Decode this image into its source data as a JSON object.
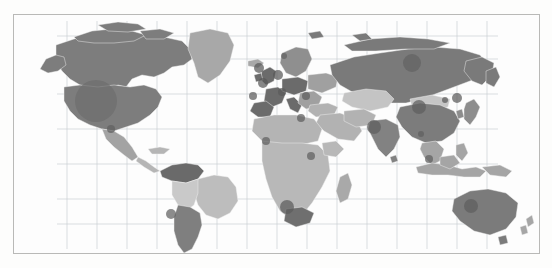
{
  "figure": {
    "kind": "world-choropleth-map",
    "projection": "equirectangular",
    "background_color": "#fdfdfc",
    "panel_color": "#fdfdfd",
    "frame_color": "#b9b9b7",
    "graticule_color": "#c9cfd2",
    "country_border_color": "#f3f4f4",
    "has_title": false,
    "has_legend": false,
    "has_axis_labels": false,
    "has_tick_labels": false
  },
  "chart_data": {
    "type": "heatmap",
    "title": "",
    "xlabel": "",
    "ylabel": "",
    "grid": true,
    "legend_position": "none",
    "graticule": {
      "lon_step_deg": 20,
      "lat_step_deg": 20,
      "vertical_lines_px": [
        66,
        96,
        126,
        156,
        186,
        216,
        246,
        276,
        306,
        336,
        366,
        396,
        426,
        456,
        486
      ],
      "horizontal_lines_px": [
        35,
        58,
        93,
        128,
        163,
        198,
        223
      ],
      "grid_left_px": 66,
      "grid_right_px": 497,
      "grid_top_px": 20,
      "grid_bottom_px": 248
    },
    "shade_scale": {
      "type": "sequential-gray",
      "levels": [
        {
          "name": "very-light",
          "hex": "#e0e0e0"
        },
        {
          "name": "light",
          "hex": "#cfcfcf"
        },
        {
          "name": "medium-light",
          "hex": "#bdbdbd"
        },
        {
          "name": "medium",
          "hex": "#a8a8a8"
        },
        {
          "name": "medium-dark",
          "hex": "#949494"
        },
        {
          "name": "dark",
          "hex": "#7d7d7d"
        },
        {
          "name": "very-dark",
          "hex": "#656565"
        }
      ]
    },
    "regions": [
      {
        "name": "Canada",
        "shade": "dark",
        "hex": "#7d7d7d"
      },
      {
        "name": "Greenland",
        "shade": "medium",
        "hex": "#a8a8a8"
      },
      {
        "name": "United States",
        "shade": "dark",
        "hex": "#7d7d7d"
      },
      {
        "name": "Mexico",
        "shade": "medium",
        "hex": "#a3a3a3"
      },
      {
        "name": "Central America",
        "shade": "medium-light",
        "hex": "#b5b5b5"
      },
      {
        "name": "Colombia / Venezuela",
        "shade": "very-dark",
        "hex": "#6a6a6a"
      },
      {
        "name": "Brazil",
        "shade": "medium-light",
        "hex": "#bdbdbd"
      },
      {
        "name": "Peru / Bolivia",
        "shade": "light",
        "hex": "#c9c9c9"
      },
      {
        "name": "Argentina / Chile",
        "shade": "dark",
        "hex": "#7f7f7f"
      },
      {
        "name": "Western Europe",
        "shade": "very-dark",
        "hex": "#6b6b6b"
      },
      {
        "name": "Scandinavia",
        "shade": "medium-dark",
        "hex": "#8f8f8f"
      },
      {
        "name": "Eastern Europe",
        "shade": "medium",
        "hex": "#a0a0a0"
      },
      {
        "name": "Russia",
        "shade": "dark",
        "hex": "#7a7a7a"
      },
      {
        "name": "Kazakhstan / Central Asia",
        "shade": "light",
        "hex": "#c4c4c4"
      },
      {
        "name": "Middle East",
        "shade": "medium-light",
        "hex": "#b2b2b2"
      },
      {
        "name": "India",
        "shade": "dark",
        "hex": "#828282"
      },
      {
        "name": "China",
        "shade": "dark",
        "hex": "#7c7c7c"
      },
      {
        "name": "Mongolia",
        "shade": "light",
        "hex": "#c6c6c6"
      },
      {
        "name": "Japan",
        "shade": "medium-dark",
        "hex": "#8d8d8d"
      },
      {
        "name": "Southeast Asia",
        "shade": "medium",
        "hex": "#a5a5a5"
      },
      {
        "name": "Indonesia",
        "shade": "medium",
        "hex": "#a5a5a5"
      },
      {
        "name": "North Africa",
        "shade": "medium-light",
        "hex": "#b4b4b4"
      },
      {
        "name": "Sub-Saharan Africa",
        "shade": "medium-light",
        "hex": "#b8b8b8"
      },
      {
        "name": "South Africa",
        "shade": "very-dark",
        "hex": "#6f6f6f"
      },
      {
        "name": "Madagascar",
        "shade": "medium",
        "hex": "#a9a9a9"
      },
      {
        "name": "Australia",
        "shade": "dark",
        "hex": "#7b7b7b"
      },
      {
        "name": "New Zealand",
        "shade": "medium",
        "hex": "#a6a6a6"
      }
    ],
    "markers": [
      {
        "label": "United States",
        "cx_px": 95,
        "cy_px": 100,
        "r_px": 21,
        "hex": "#6d6d6d"
      },
      {
        "label": "Mexico",
        "cx_px": 110,
        "cy_px": 128,
        "r_px": 4,
        "hex": "#5f5f5f"
      },
      {
        "label": "Argentina",
        "cx_px": 170,
        "cy_px": 213,
        "r_px": 5,
        "hex": "#5f5f5f"
      },
      {
        "label": "United Kingdom",
        "cx_px": 258,
        "cy_px": 67,
        "r_px": 5,
        "hex": "#575757"
      },
      {
        "label": "France",
        "cx_px": 262,
        "cy_px": 82,
        "r_px": 5,
        "hex": "#575757"
      },
      {
        "label": "Germany",
        "cx_px": 277,
        "cy_px": 74,
        "r_px": 5,
        "hex": "#575757"
      },
      {
        "label": "Italy",
        "cx_px": 281,
        "cy_px": 91,
        "r_px": 4,
        "hex": "#5a5a5a"
      },
      {
        "label": "Spain",
        "cx_px": 252,
        "cy_px": 95,
        "r_px": 4,
        "hex": "#5a5a5a"
      },
      {
        "label": "Sweden",
        "cx_px": 283,
        "cy_px": 55,
        "r_px": 3,
        "hex": "#636363"
      },
      {
        "label": "Turkey",
        "cx_px": 305,
        "cy_px": 95,
        "r_px": 4,
        "hex": "#5d5d5d"
      },
      {
        "label": "Egypt",
        "cx_px": 300,
        "cy_px": 117,
        "r_px": 4,
        "hex": "#5d5d5d"
      },
      {
        "label": "Nigeria",
        "cx_px": 265,
        "cy_px": 140,
        "r_px": 4,
        "hex": "#5f5f5f"
      },
      {
        "label": "Kenya",
        "cx_px": 310,
        "cy_px": 155,
        "r_px": 4,
        "hex": "#5f5f5f"
      },
      {
        "label": "South Africa",
        "cx_px": 286,
        "cy_px": 206,
        "r_px": 7,
        "hex": "#5c5c5c"
      },
      {
        "label": "Russia",
        "cx_px": 411,
        "cy_px": 62,
        "r_px": 9,
        "hex": "#636363"
      },
      {
        "label": "China",
        "cx_px": 418,
        "cy_px": 106,
        "r_px": 7,
        "hex": "#5e5e5e"
      },
      {
        "label": "India",
        "cx_px": 373,
        "cy_px": 126,
        "r_px": 7,
        "hex": "#5e5e5e"
      },
      {
        "label": "Japan",
        "cx_px": 456,
        "cy_px": 97,
        "r_px": 5,
        "hex": "#5a5a5a"
      },
      {
        "label": "South Korea",
        "cx_px": 444,
        "cy_px": 99,
        "r_px": 3,
        "hex": "#5a5a5a"
      },
      {
        "label": "Thailand",
        "cx_px": 420,
        "cy_px": 133,
        "r_px": 3,
        "hex": "#5f5f5f"
      },
      {
        "label": "Indonesia",
        "cx_px": 428,
        "cy_px": 158,
        "r_px": 4,
        "hex": "#5f5f5f"
      },
      {
        "label": "Australia",
        "cx_px": 470,
        "cy_px": 205,
        "r_px": 7,
        "hex": "#5e5e5e"
      }
    ]
  }
}
